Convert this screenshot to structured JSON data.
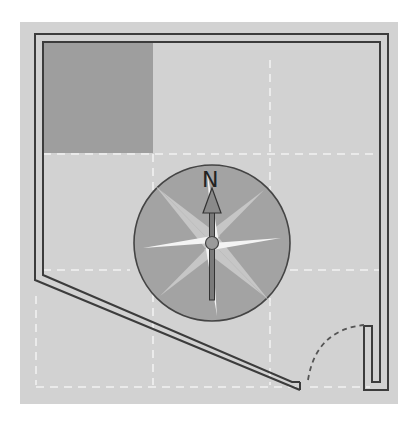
{
  "floorplan": {
    "compass": {
      "north_label": "N",
      "direction": "north-up"
    },
    "colors": {
      "background": "#d2d2d2",
      "wall": "#3c3c3c",
      "shaded_room": "#9e9e9e",
      "compass_disc": "#a3a3a3",
      "compass_star_light": "#c8c8c8",
      "compass_star_white": "#f4f4f4",
      "grid_dash": "#f0f0f0"
    }
  }
}
